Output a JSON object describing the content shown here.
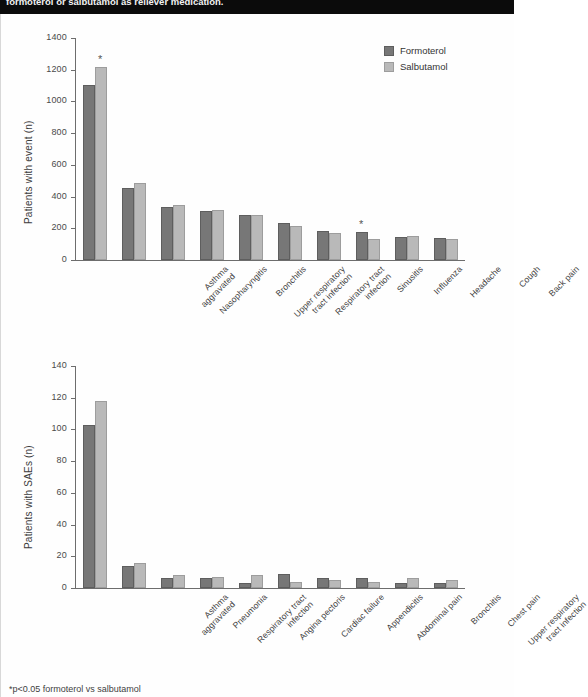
{
  "header": {
    "title": "formoterol or salbutamol as reliever medication."
  },
  "legend": {
    "position": "top-right",
    "items": [
      {
        "label": "Formoterol",
        "color": "#777777"
      },
      {
        "label": "Salbutamol",
        "color": "#b9b9b9"
      }
    ]
  },
  "footnote": "*p<0.05 formoterol vs salbutamol",
  "chart_data": [
    {
      "type": "bar",
      "title": "",
      "xlabel": "",
      "ylabel": "Patients with event (n)",
      "ylim": [
        0,
        1400
      ],
      "yticks": [
        0,
        200,
        400,
        600,
        800,
        1000,
        1200,
        1400
      ],
      "grid": false,
      "legend": [
        "Formoterol",
        "Salbutamol"
      ],
      "categories": [
        "Asthma\naggravated",
        "Nasopharyngitis",
        "Bronchitis",
        "Upper respiratory\ntract infection",
        "Respiratory tract\ninfection",
        "Sinusitis",
        "Influenza",
        "Headache",
        "Cough",
        "Back pain"
      ],
      "series": [
        {
          "name": "Formoterol",
          "values": [
            1105,
            455,
            335,
            310,
            283,
            233,
            180,
            175,
            148,
            137
          ]
        },
        {
          "name": "Salbutamol",
          "values": [
            1215,
            485,
            345,
            315,
            283,
            215,
            172,
            135,
            150,
            133
          ]
        }
      ],
      "annotations": [
        {
          "category": "Asthma\naggravated",
          "series": "Salbutamol",
          "marker": "*"
        },
        {
          "category": "Headache",
          "series": "Formoterol",
          "marker": "*"
        }
      ]
    },
    {
      "type": "bar",
      "title": "",
      "xlabel": "",
      "ylabel": "Patients with SAEs (n)",
      "ylim": [
        0,
        140
      ],
      "yticks": [
        0,
        20,
        40,
        60,
        80,
        100,
        120,
        140
      ],
      "grid": false,
      "legend": [
        "Formoterol",
        "Salbutamol"
      ],
      "categories": [
        "Asthma\naggravated",
        "Pneumonia",
        "Respiratory tract\ninfection",
        "Angina pectoris",
        "Cardiac failure",
        "Appendicitis",
        "Abdominal pain",
        "Bronchitis",
        "Chest pain",
        "Upper respiratory\ntract infection"
      ],
      "series": [
        {
          "name": "Formoterol",
          "values": [
            103,
            14,
            6,
            6,
            3,
            9,
            6,
            6,
            3,
            3
          ]
        },
        {
          "name": "Salbutamol",
          "values": [
            118,
            16,
            8,
            7,
            8,
            4,
            5,
            4,
            6,
            5
          ]
        }
      ],
      "annotations": []
    }
  ]
}
